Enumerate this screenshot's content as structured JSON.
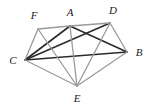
{
  "figure": {
    "type": "undirected-graph-drawing",
    "width": 152,
    "height": 105,
    "background_color": "#ffffff"
  },
  "colors": {
    "dark_edge": "#2b2b2b",
    "light_edge": "#9a9a9a",
    "label_text": "#1a1a1a",
    "background": "#ffffff"
  },
  "vertices": [
    {
      "id": "F",
      "label": "F",
      "x": 38,
      "y": 29,
      "label_x": 34,
      "label_y": 15
    },
    {
      "id": "A",
      "label": "A",
      "x": 70,
      "y": 26,
      "label_x": 70,
      "label_y": 12
    },
    {
      "id": "D",
      "label": "D",
      "x": 110,
      "y": 23,
      "label_x": 113,
      "label_y": 10
    },
    {
      "id": "C",
      "label": "C",
      "x": 25,
      "y": 60,
      "label_x": 13,
      "label_y": 60
    },
    {
      "id": "B",
      "label": "B",
      "x": 127,
      "y": 52,
      "label_x": 139,
      "label_y": 52
    },
    {
      "id": "E",
      "label": "E",
      "x": 77,
      "y": 86,
      "label_x": 77,
      "label_y": 98
    }
  ],
  "edges": [
    {
      "id": "edge-C-A",
      "from": "C",
      "to": "A",
      "style": "dark",
      "width": 1.6
    },
    {
      "id": "edge-C-D",
      "from": "C",
      "to": "D",
      "style": "dark",
      "width": 1.6
    },
    {
      "id": "edge-C-B",
      "from": "C",
      "to": "B",
      "style": "dark",
      "width": 1.6
    },
    {
      "id": "edge-A-B",
      "from": "A",
      "to": "B",
      "style": "dark",
      "width": 1.6
    },
    {
      "id": "edge-F-A",
      "from": "F",
      "to": "A",
      "style": "light",
      "width": 1.3
    },
    {
      "id": "edge-A-D",
      "from": "A",
      "to": "D",
      "style": "light",
      "width": 1.3
    },
    {
      "id": "edge-F-C",
      "from": "F",
      "to": "C",
      "style": "light",
      "width": 1.3
    },
    {
      "id": "edge-F-E",
      "from": "F",
      "to": "E",
      "style": "light",
      "width": 1.3
    },
    {
      "id": "edge-D-B",
      "from": "D",
      "to": "B",
      "style": "light",
      "width": 1.3
    },
    {
      "id": "edge-D-E",
      "from": "D",
      "to": "E",
      "style": "light",
      "width": 1.3
    },
    {
      "id": "edge-C-E",
      "from": "C",
      "to": "E",
      "style": "light",
      "width": 1.3
    },
    {
      "id": "edge-E-B",
      "from": "E",
      "to": "B",
      "style": "light",
      "width": 1.3
    },
    {
      "id": "edge-A-E",
      "from": "A",
      "to": "E",
      "style": "light",
      "width": 1.3
    }
  ]
}
